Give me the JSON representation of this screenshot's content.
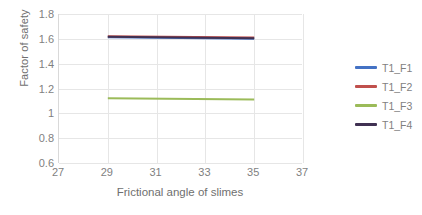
{
  "chart_data": {
    "type": "line",
    "title": "",
    "subtitle": "",
    "xlabel": "Frictional angle of slimes",
    "ylabel": "Factor of safety",
    "xlim": [
      27,
      37
    ],
    "ylim": [
      0.6,
      1.8
    ],
    "xticks": [
      "27",
      "29",
      "31",
      "33",
      "35",
      "37"
    ],
    "yticks": [
      "0.6",
      "0.8",
      "1",
      "1.2",
      "1.4",
      "1.6",
      "1.8"
    ],
    "xtick_values": [
      27,
      29,
      31,
      33,
      35,
      37
    ],
    "ytick_values": [
      0.6,
      0.8,
      1.0,
      1.2,
      1.4,
      1.6,
      1.8
    ],
    "grid": true,
    "legend_position": "right",
    "x": [
      29,
      35
    ],
    "series": [
      {
        "name": "T1_F1",
        "color": "#4472c4",
        "values": [
          1.612,
          1.601
        ]
      },
      {
        "name": "T1_F2",
        "color": "#c0504d",
        "values": [
          1.621,
          1.611
        ]
      },
      {
        "name": "T1_F3",
        "color": "#9bbb59",
        "values": [
          1.122,
          1.112
        ]
      },
      {
        "name": "T1_F4",
        "color": "#403152",
        "values": [
          1.616,
          1.605
        ]
      }
    ]
  },
  "legend": {
    "items": [
      {
        "label": "T1_F1",
        "color": "#4472c4"
      },
      {
        "label": "T1_F2",
        "color": "#c0504d"
      },
      {
        "label": "T1_F3",
        "color": "#9bbb59"
      },
      {
        "label": "T1_F4",
        "color": "#403152"
      }
    ]
  },
  "colors": {
    "background": "#ffffff",
    "gridline": "#e6e6e6",
    "axis": "#d9d9d9",
    "tick_text": "#7f7f7f",
    "title_text": "#6f6f6f"
  }
}
